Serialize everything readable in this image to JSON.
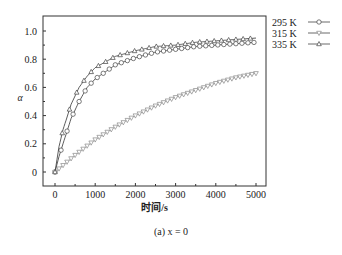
{
  "chart_data": {
    "type": "line",
    "title": "",
    "caption": "(a) x = 0",
    "xlabel": "时间/s",
    "ylabel": "α",
    "xlim": [
      -300,
      5300
    ],
    "ylim": [
      -0.1,
      1.1
    ],
    "xticks": [
      0,
      1000,
      2000,
      3000,
      4000,
      5000
    ],
    "yticks": [
      0,
      0.2,
      0.4,
      0.6,
      0.8,
      1.0
    ],
    "ytick_labels": [
      "0",
      "0.2",
      "0.4",
      "0.6",
      "0.8",
      "1.0"
    ],
    "legend_position": "outside-right-top",
    "series": [
      {
        "name": "295 K",
        "marker": "circle",
        "x": [
          0,
          100,
          200,
          400,
          600,
          800,
          1000,
          1500,
          2000,
          2500,
          3000,
          3500,
          4000,
          4500,
          5000
        ],
        "values": [
          0,
          0.11,
          0.2,
          0.38,
          0.5,
          0.6,
          0.66,
          0.76,
          0.81,
          0.85,
          0.87,
          0.89,
          0.9,
          0.91,
          0.92
        ]
      },
      {
        "name": "315 K",
        "marker": "triangle-down",
        "x": [
          0,
          250,
          500,
          1000,
          1500,
          2000,
          2500,
          3000,
          3500,
          4000,
          4500,
          5000
        ],
        "values": [
          0,
          0.06,
          0.12,
          0.23,
          0.32,
          0.4,
          0.47,
          0.53,
          0.58,
          0.63,
          0.67,
          0.7
        ]
      },
      {
        "name": "335 K",
        "marker": "triangle-up",
        "x": [
          0,
          100,
          200,
          400,
          600,
          800,
          1000,
          1500,
          2000,
          2500,
          3000,
          3500,
          4000,
          4500,
          5000
        ],
        "values": [
          0,
          0.18,
          0.3,
          0.48,
          0.6,
          0.68,
          0.74,
          0.82,
          0.86,
          0.89,
          0.9,
          0.92,
          0.93,
          0.94,
          0.95
        ]
      }
    ]
  },
  "legend": {
    "items": [
      "295 K",
      "315 K",
      "335 K"
    ]
  }
}
